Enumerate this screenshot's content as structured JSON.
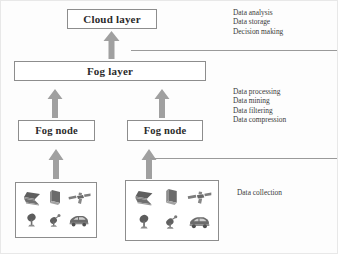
{
  "diagram": {
    "layers": {
      "cloud": {
        "label": "Cloud layer"
      },
      "fog": {
        "label": "Fog layer"
      },
      "fog_node_left": {
        "label": "Fog node"
      },
      "fog_node_right": {
        "label": "Fog node"
      }
    },
    "annotations": {
      "cloud_functions": [
        "Data analysis",
        "Data storage",
        "Decision making"
      ],
      "fog_functions": [
        "Data processing",
        "Data mining",
        "Data filtering",
        "Data compression"
      ],
      "edge_functions": [
        "Data collection"
      ]
    },
    "device_groups": [
      {
        "name": "edge-devices-left",
        "devices": [
          "laptop-icon",
          "tablet-icon",
          "satellite-icon",
          "satellite-dish-icon",
          "antenna-icon",
          "car-icon"
        ]
      },
      {
        "name": "edge-devices-right",
        "devices": [
          "laptop-icon",
          "tablet-icon",
          "satellite-icon",
          "satellite-dish-icon",
          "antenna-icon",
          "car-icon"
        ]
      }
    ],
    "arrows": [
      {
        "name": "arrow-fog-to-cloud",
        "direction": "up"
      },
      {
        "name": "arrow-fog-node-left-to-fog-layer",
        "direction": "up"
      },
      {
        "name": "arrow-fog-node-right-to-fog-layer",
        "direction": "up"
      },
      {
        "name": "arrow-devices-left-to-fog-node-left",
        "direction": "up"
      },
      {
        "name": "arrow-devices-right-to-fog-node-right",
        "direction": "up"
      }
    ],
    "colors": {
      "box_border": "#8d8d8d",
      "arrow_fill": "#a0a0a0",
      "rule": "#9a9a9a",
      "text": "#2b2b2b",
      "annotation_text": "#3a3a3a",
      "device_icon": "#6e6e6e",
      "background": "#fdfdfd"
    }
  }
}
